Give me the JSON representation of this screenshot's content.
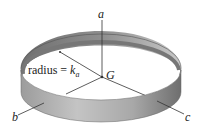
{
  "diagram": {
    "labels": {
      "axis_a": "a",
      "axis_b": "b",
      "axis_c": "c",
      "center": "G",
      "radius_text": "radius = ",
      "radius_symbol": "k",
      "radius_subscript": "a"
    },
    "colors": {
      "ring_outer_light": "#b8b8b8",
      "ring_outer_dark": "#7a7a7a",
      "ring_inner": "#8a8a8a",
      "axis_line": "#333333"
    }
  }
}
